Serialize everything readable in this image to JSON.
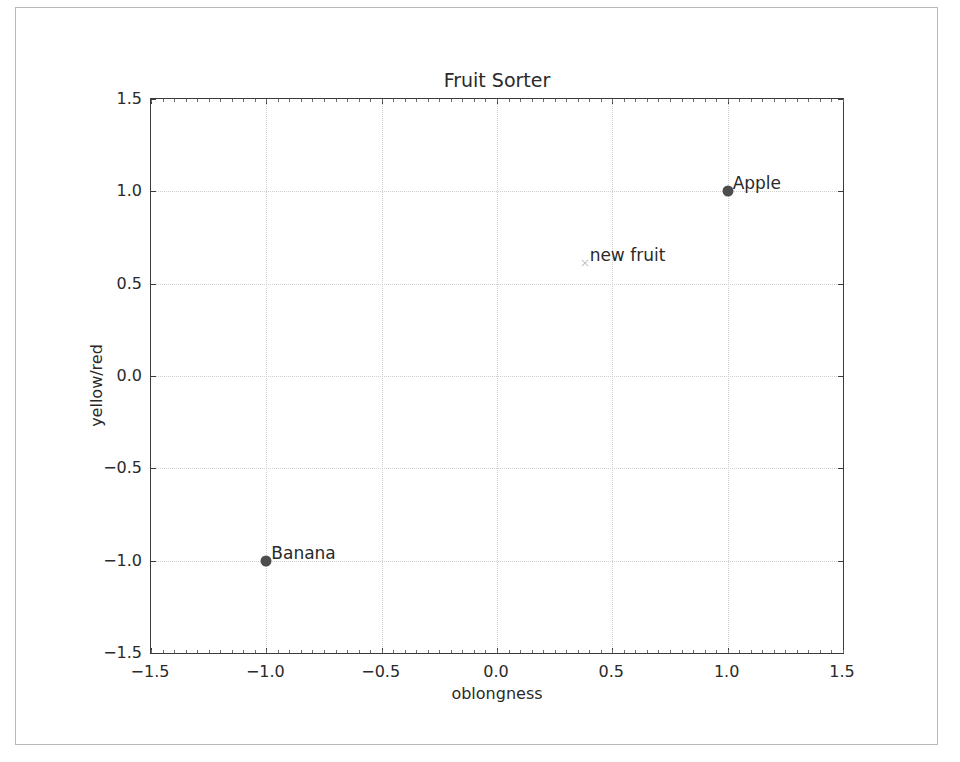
{
  "window": {
    "title": "Fruit Sorter"
  },
  "chart_data": {
    "type": "scatter",
    "title": "Fruit Sorter",
    "xlabel": "oblongness",
    "ylabel": "yellow/red",
    "xlim": [
      -1.5,
      1.5
    ],
    "ylim": [
      -1.5,
      1.5
    ],
    "grid": true,
    "legend": "none",
    "xticks": [
      -1.5,
      -1.0,
      -0.5,
      0.0,
      0.5,
      1.0,
      1.5
    ],
    "xtick_labels": [
      "−1.5",
      "−1.0",
      "−0.5",
      "0.0",
      "0.5",
      "1.0",
      "1.5"
    ],
    "yticks": [
      -1.5,
      -1.0,
      -0.5,
      0.0,
      0.5,
      1.0,
      1.5
    ],
    "ytick_labels": [
      "−1.5",
      "−1.0",
      "−0.5",
      "0.0",
      "0.5",
      "1.0",
      "1.5"
    ],
    "points": [
      {
        "label": "Apple",
        "x": 1.0,
        "y": 1.0,
        "marker": "circle",
        "color": "#4d4d4d",
        "size": 11
      },
      {
        "label": "new fruit",
        "x": 0.38,
        "y": 0.61,
        "marker": "x",
        "color": "#c2c2c2",
        "size": 9
      },
      {
        "label": "Banana",
        "x": -1.0,
        "y": -1.0,
        "marker": "circle",
        "color": "#4d4d4d",
        "size": 11
      }
    ]
  },
  "style": {
    "background": "#ffffff",
    "axis_color": "#3b3b3b",
    "grid_color": "#cfcfcf",
    "text_color": "#2a2a2a",
    "window_border": "#b9b9b9"
  }
}
